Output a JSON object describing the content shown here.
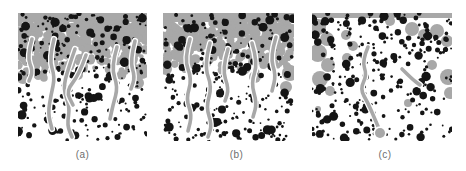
{
  "figure": {
    "colors": {
      "background": "#ffffff",
      "matrix_gray": "#a8a8a8",
      "tendril_gray": "#a8a8a8",
      "halo_white": "#ffffff",
      "particle_black": "#151515",
      "label_text": "#6e6e6e"
    },
    "panels": [
      {
        "label": "(a)",
        "x": 18,
        "y": 13,
        "width": 129,
        "height": 128,
        "label_dx": 0,
        "seed": 20,
        "particle_count": 265,
        "band": {
          "solid": 9,
          "fade": 64,
          "coverage_pow": 0.8
        },
        "patches": [
          [
            124,
            58,
            8
          ],
          [
            120,
            70,
            6
          ],
          [
            5,
            64,
            7
          ],
          [
            60,
            62,
            5
          ]
        ],
        "tendrils": [
          [
            [
              14,
              26
            ],
            [
              9,
              44
            ],
            [
              15,
              58
            ],
            [
              11,
              68
            ]
          ],
          [
            [
              36,
              26
            ],
            [
              31,
              46
            ],
            [
              37,
              64
            ],
            [
              33,
              82
            ],
            [
              30,
              100
            ],
            [
              34,
              116
            ]
          ],
          [
            [
              57,
              36
            ],
            [
              50,
              56
            ],
            [
              45,
              76
            ],
            [
              52,
              94
            ],
            [
              49,
              112
            ],
            [
              54,
              124
            ]
          ],
          [
            [
              68,
              42
            ],
            [
              61,
              62
            ],
            [
              48,
              78
            ],
            [
              55,
              92
            ]
          ],
          [
            [
              99,
              34
            ],
            [
              93,
              54
            ],
            [
              100,
              74
            ],
            [
              95,
              92
            ],
            [
              92,
              106
            ]
          ],
          [
            [
              117,
              28
            ],
            [
              112,
              48
            ],
            [
              117,
              64
            ],
            [
              113,
              76
            ]
          ]
        ],
        "tendril_bulbs": []
      },
      {
        "label": "(b)",
        "x": 163,
        "y": 13,
        "width": 131,
        "height": 128,
        "label_dx": 8,
        "seed": 77,
        "particle_count": 265,
        "band": {
          "solid": 9,
          "fade": 60,
          "coverage_pow": 0.8
        },
        "patches": [
          [
            127,
            60,
            8
          ],
          [
            123,
            74,
            6
          ],
          [
            3,
            56,
            6
          ],
          [
            92,
            64,
            6
          ]
        ],
        "tendrils": [
          [
            [
              27,
              26
            ],
            [
              21,
              46
            ],
            [
              29,
              66
            ],
            [
              23,
              86
            ],
            [
              29,
              102
            ],
            [
              25,
              118
            ]
          ],
          [
            [
              47,
              30
            ],
            [
              41,
              52
            ],
            [
              49,
              74
            ],
            [
              43,
              94
            ],
            [
              49,
              112
            ],
            [
              45,
              124
            ]
          ],
          [
            [
              65,
              36
            ],
            [
              59,
              56
            ],
            [
              66,
              76
            ],
            [
              62,
              88
            ]
          ],
          [
            [
              89,
              30
            ],
            [
              95,
              50
            ],
            [
              88,
              70
            ],
            [
              94,
              90
            ],
            [
              90,
              104
            ]
          ],
          [
            [
              113,
              24
            ],
            [
              107,
              44
            ],
            [
              113,
              62
            ],
            [
              109,
              78
            ]
          ]
        ],
        "tendril_bulbs": []
      },
      {
        "label": "(c)",
        "x": 312,
        "y": 13,
        "width": 140,
        "height": 128,
        "label_dx": 3,
        "seed": 5,
        "particle_count": 275,
        "band": {
          "solid": 5,
          "fade": 5,
          "coverage_pow": 1
        },
        "patches": [
          [
            6,
            14,
            8
          ],
          [
            15,
            26,
            7
          ],
          [
            6,
            40,
            9
          ],
          [
            16,
            52,
            7
          ],
          [
            8,
            66,
            8
          ],
          [
            18,
            78,
            5
          ],
          [
            34,
            22,
            5
          ],
          [
            41,
            33,
            5
          ],
          [
            35,
            45,
            5
          ],
          [
            100,
            16,
            7
          ],
          [
            112,
            22,
            6
          ],
          [
            125,
            18,
            7
          ],
          [
            135,
            28,
            6
          ],
          [
            136,
            64,
            8
          ],
          [
            138,
            80,
            6
          ],
          [
            120,
            52,
            5
          ],
          [
            96,
            90,
            4
          ],
          [
            78,
            8,
            5
          ],
          [
            6,
            96,
            3
          ]
        ],
        "tendrils": [
          [
            [
              56,
              34
            ],
            [
              50,
              48
            ],
            [
              55,
              62
            ],
            [
              48,
              76
            ],
            [
              56,
              90
            ],
            [
              62,
              104
            ],
            [
              68,
              118
            ]
          ],
          [
            [
              90,
              56
            ],
            [
              100,
              66
            ],
            [
              108,
              72
            ]
          ]
        ],
        "tendril_bulbs": [
          [
            68,
            120,
            5
          ]
        ]
      }
    ]
  }
}
